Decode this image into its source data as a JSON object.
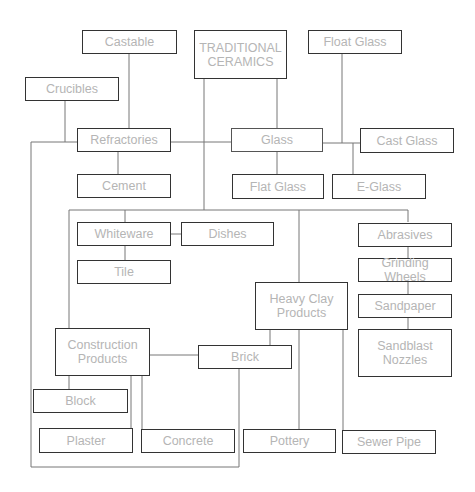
{
  "diagram": {
    "title": "TRADITIONAL\nCERAMICS",
    "nodes": {
      "castable": "Castable",
      "traditional_ceramics": "TRADITIONAL\nCERAMICS",
      "float_glass": "Float Glass",
      "crucibles": "Crucibles",
      "refractories": "Refractories",
      "glass": "Glass",
      "cast_glass": "Cast Glass",
      "cement": "Cement",
      "flat_glass": "Flat Glass",
      "e_glass": "E-Glass",
      "whiteware": "Whiteware",
      "dishes": "Dishes",
      "tile": "Tile",
      "abrasives": "Abrasives",
      "grinding_wheels": "Grinding Wheels",
      "sandpaper": "Sandpaper",
      "sandblast_nozzles": "Sandblast\nNozzles",
      "heavy_clay_products": "Heavy Clay\nProducts",
      "construction_products": "Construction\nProducts",
      "brick": "Brick",
      "block": "Block",
      "plaster": "Plaster",
      "concrete": "Concrete",
      "pottery": "Pottery",
      "sewer_pipe": "Sewer Pipe"
    },
    "edges": [
      [
        "traditional_ceramics",
        "glass"
      ],
      [
        "traditional_ceramics",
        "whiteware"
      ],
      [
        "traditional_ceramics",
        "heavy_clay_products"
      ],
      [
        "traditional_ceramics",
        "abrasives"
      ],
      [
        "traditional_ceramics",
        "construction_products"
      ],
      [
        "castable",
        "refractories"
      ],
      [
        "crucibles",
        "refractories"
      ],
      [
        "refractories",
        "glass"
      ],
      [
        "refractories",
        "cement"
      ],
      [
        "refractories",
        "brick"
      ],
      [
        "glass",
        "flat_glass"
      ],
      [
        "glass",
        "float_glass"
      ],
      [
        "glass",
        "cast_glass"
      ],
      [
        "glass",
        "e_glass"
      ],
      [
        "whiteware",
        "dishes"
      ],
      [
        "whiteware",
        "tile"
      ],
      [
        "abrasives",
        "grinding_wheels"
      ],
      [
        "grinding_wheels",
        "sandpaper"
      ],
      [
        "sandpaper",
        "sandblast_nozzles"
      ],
      [
        "heavy_clay_products",
        "brick"
      ],
      [
        "heavy_clay_products",
        "pottery"
      ],
      [
        "heavy_clay_products",
        "sewer_pipe"
      ],
      [
        "construction_products",
        "brick"
      ],
      [
        "construction_products",
        "block"
      ],
      [
        "construction_products",
        "plaster"
      ],
      [
        "construction_products",
        "concrete"
      ]
    ]
  }
}
